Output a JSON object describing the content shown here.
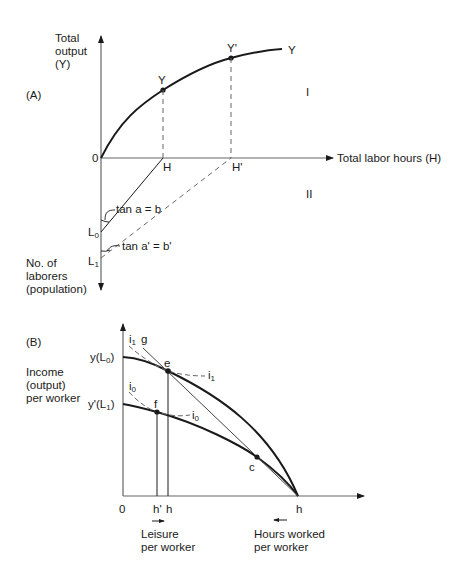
{
  "panel_a": {
    "tag": "(A)",
    "y_axis_label": [
      "Total",
      "output",
      "(Y)"
    ],
    "x_axis_label": "Total labor hours (H)",
    "neg_y_axis_label": [
      "No. of",
      "laborers",
      "(population)"
    ],
    "origin": "0",
    "curve_label": "Y",
    "point_y": "Y",
    "point_y_prime": "Y'",
    "tick_h": "H",
    "tick_h_prime": "H'",
    "quadrant_1": "I",
    "quadrant_2": "II",
    "l0_main": "L",
    "l0_sub": "0",
    "l1_main": "L",
    "l1_sub": "1",
    "angle_a": "tan a = b",
    "angle_a_prime": "tan a' = b'"
  },
  "panel_b": {
    "tag": "(B)",
    "y_axis_label": [
      "Income",
      "(output)",
      "per worker"
    ],
    "y_l0": "y(L",
    "y_l0_sub": "0",
    "y_l0_close": ")",
    "y_l1": "y'(L",
    "y_l1_sub": "1",
    "y_l1_close": ")",
    "origin": "0",
    "tick_h_prime": "h'",
    "tick_h": "h",
    "tick_h_end": "h",
    "point_e": "e",
    "point_f": "f",
    "point_c": "c",
    "line_g": "g",
    "i1_main": "i",
    "i1_sub": "1",
    "i0_main": "i",
    "i0_sub": "0",
    "leisure_label": [
      "Leisure",
      "per worker"
    ],
    "hours_label": [
      "Hours worked",
      "per worker"
    ]
  },
  "colors": {
    "line": "#1a1a1a",
    "axis": "#555555",
    "dash": "#666666"
  }
}
